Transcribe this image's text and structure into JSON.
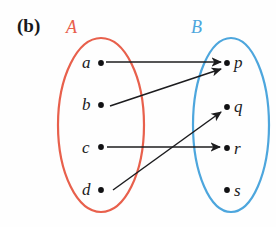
{
  "figure": {
    "part_label": "(b)",
    "width": 276,
    "height": 227,
    "background_color": "#fefefe"
  },
  "colors": {
    "set_a_color": "#e8604c",
    "set_b_color": "#4da6dd",
    "text_color": "#1a1a1c",
    "arrow_color": "#1c1c1e",
    "dot_color": "#111113"
  },
  "sets": {
    "a": {
      "name": "A",
      "label_x": 66,
      "label_y": 17,
      "ellipse": {
        "cx": 101,
        "cy": 125,
        "rx": 43,
        "ry": 87
      },
      "elements": [
        {
          "id": "a",
          "label": "a",
          "dot_x": 101,
          "dot_y": 63,
          "label_x": 82,
          "label_y": 53
        },
        {
          "id": "b",
          "label": "b",
          "dot_x": 101,
          "dot_y": 105,
          "label_x": 82,
          "label_y": 95
        },
        {
          "id": "c",
          "label": "c",
          "dot_x": 101,
          "dot_y": 147,
          "label_x": 82,
          "label_y": 138
        },
        {
          "id": "d",
          "label": "d",
          "dot_x": 101,
          "dot_y": 190,
          "label_x": 82,
          "label_y": 180
        }
      ]
    },
    "b": {
      "name": "B",
      "label_x": 191,
      "label_y": 17,
      "ellipse": {
        "cx": 231,
        "cy": 125,
        "rx": 38,
        "ry": 87
      },
      "elements": [
        {
          "id": "p",
          "label": "p",
          "dot_x": 227,
          "dot_y": 63,
          "label_x": 234,
          "label_y": 53
        },
        {
          "id": "q",
          "label": "q",
          "dot_x": 227,
          "dot_y": 107,
          "label_x": 234,
          "label_y": 97
        },
        {
          "id": "r",
          "label": "r",
          "dot_x": 227,
          "dot_y": 148,
          "label_x": 234,
          "label_y": 139
        },
        {
          "id": "s",
          "label": "s",
          "dot_x": 227,
          "dot_y": 190,
          "label_x": 234,
          "label_y": 181
        }
      ]
    }
  },
  "chart_data": {
    "type": "diagram",
    "title": "(b)",
    "diagram_kind": "arrow-diagram-mapping",
    "domain_set": "A",
    "codomain_set": "B",
    "domain_elements": [
      "a",
      "b",
      "c",
      "d"
    ],
    "codomain_elements": [
      "p",
      "q",
      "r",
      "s"
    ],
    "mappings": [
      {
        "from": "a",
        "to": "p",
        "x1": 106,
        "y1": 62,
        "x2": 221,
        "y2": 62
      },
      {
        "from": "b",
        "to": "p",
        "x1": 110,
        "y1": 106,
        "x2": 221,
        "y2": 69
      },
      {
        "from": "c",
        "to": "r",
        "x1": 107,
        "y1": 147,
        "x2": 220,
        "y2": 147
      },
      {
        "from": "d",
        "to": "q",
        "x1": 113,
        "y1": 190,
        "x2": 221,
        "y2": 112
      }
    ],
    "unmapped_codomain_elements": [
      "s"
    ]
  }
}
